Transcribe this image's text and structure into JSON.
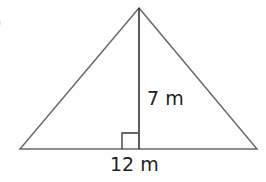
{
  "figure": {
    "type": "triangle",
    "fragment_label": ")",
    "height_label": "7 m",
    "base_label": "12 m",
    "right_angle_marker": true,
    "colors": {
      "stroke": "#6a6a6a",
      "altitude": "#333333",
      "text": "#1e1e1e"
    }
  }
}
